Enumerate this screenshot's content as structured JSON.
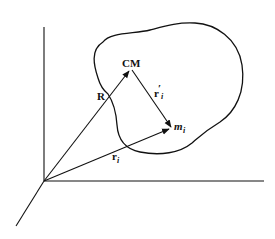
{
  "diagram": {
    "labels": {
      "cm": "CM",
      "R": "R",
      "r_prime_base": "r",
      "r_prime_mark": "′",
      "r_prime_sub": "i",
      "r_base": "r",
      "r_sub": "i",
      "m_base": "m",
      "m_sub": "i"
    },
    "vectors": [
      {
        "name": "R",
        "from": "origin",
        "to": "CM"
      },
      {
        "name": "r'_i",
        "from": "CM",
        "to": "m_i"
      },
      {
        "name": "r_i",
        "from": "origin",
        "to": "m_i"
      }
    ],
    "axes": [
      "vertical-axis",
      "horizontal-axis",
      "depth-axis"
    ],
    "colors": {
      "stroke": "#111111",
      "background": "#ffffff"
    }
  }
}
